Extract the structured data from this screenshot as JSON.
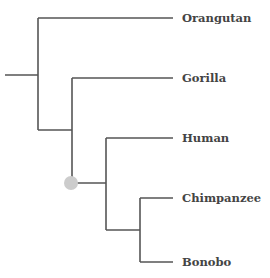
{
  "diagram": {
    "type": "phylogenetic-tree",
    "line_color": "#555555",
    "node_marker_color": "#cccccc",
    "leaves": [
      {
        "label": "Orangutan",
        "y": 18
      },
      {
        "label": "Gorilla",
        "y": 78
      },
      {
        "label": "Human",
        "y": 138
      },
      {
        "label": "Chimpanzee",
        "y": 198
      },
      {
        "label": "Bonobo",
        "y": 262
      }
    ],
    "highlighted_node": "Human-Chimpanzee-Bonobo ancestor"
  }
}
